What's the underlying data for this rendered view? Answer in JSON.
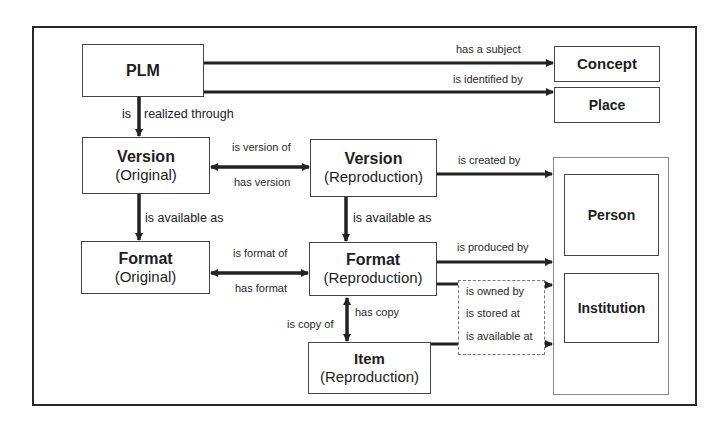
{
  "diagram": {
    "nodes": {
      "plm": {
        "title": "PLM"
      },
      "concept": {
        "title": "Concept"
      },
      "place": {
        "title": "Place"
      },
      "version_original": {
        "title": "Version",
        "subtitle": "(Original)"
      },
      "version_reproduction": {
        "title": "Version",
        "subtitle": "(Reproduction)"
      },
      "format_original": {
        "title": "Format",
        "subtitle": "(Original)"
      },
      "format_reproduction": {
        "title": "Format",
        "subtitle": "(Reproduction)"
      },
      "item_reproduction": {
        "title": "Item",
        "subtitle": "(Reproduction)"
      },
      "person": {
        "title": "Person"
      },
      "institution": {
        "title": "Institution"
      }
    },
    "edges": {
      "has_a_subject": "has a subject",
      "is_identified_by": "is identified by",
      "is": "is",
      "realized_through": "realized through",
      "is_version_of": "is version of",
      "has_version": "has version",
      "is_created_by": "is created by",
      "is_available_as_original": "is available as",
      "is_available_as_reproduction": "is available as",
      "is_format_of": "is format of",
      "has_format": "has format",
      "is_produced_by": "is produced by",
      "has_copy": "has copy",
      "is_copy_of": "is copy of",
      "is_owned_by": "is owned by",
      "is_stored_at": "is stored at",
      "is_available_at": "is available at"
    }
  }
}
